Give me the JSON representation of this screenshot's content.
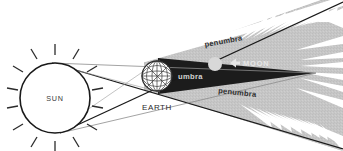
{
  "diagram": {
    "background_color": "#ffffff",
    "labels": {
      "sun": "SUN",
      "earth": "EARTH",
      "umbra": "umbra",
      "moon": "MOON",
      "penumbra_upper": "penumbra",
      "penumbra_lower": "penumbra"
    },
    "colors": {
      "background": "#ffffff",
      "outline": "#1a1a1a",
      "umbra_fill": "#1c1c1c",
      "penumbra_fill": "#c6c6c6",
      "sun_fill": "#ffffff",
      "moon_fill": "#d8d8d8",
      "ray_line": "#8c8c8c",
      "earth_line": "#333333"
    },
    "bodies": [
      {
        "name": "sun",
        "label": "SUN",
        "shape": "circle-with-rays",
        "cx": 55,
        "cy": 98,
        "r": 35,
        "ray_count": 16
      },
      {
        "name": "earth",
        "label": "EARTH",
        "shape": "wireframe-globe",
        "cx": 157,
        "cy": 76,
        "r": 15
      },
      {
        "name": "moon",
        "label": "MOON",
        "shape": "disc",
        "cx": 215,
        "cy": 64,
        "r": 7
      }
    ],
    "shadow_regions": [
      {
        "name": "umbra",
        "label": "umbra",
        "fill": "#1c1c1c",
        "description": "dark inner cone behind earth"
      },
      {
        "name": "penumbra",
        "label": "penumbra",
        "fill": "#c6c6c6",
        "description": "light outer diverging cone, feathered edge"
      }
    ],
    "annotations": {
      "moon_arrow": "left-pointing-arrow",
      "penumbra_edge": "feathered-spikes"
    }
  }
}
